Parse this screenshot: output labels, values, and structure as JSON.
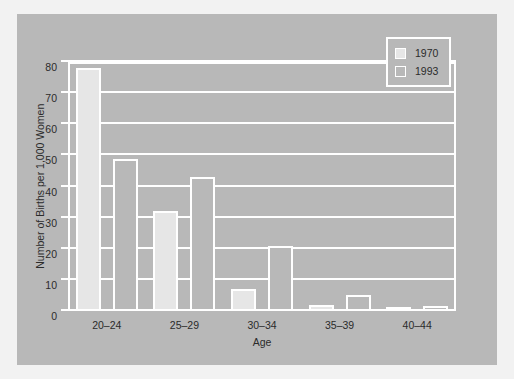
{
  "chart_data": {
    "type": "bar",
    "title": "",
    "xlabel": "Age",
    "ylabel": "Number of Births per 1,000 Women",
    "categories": [
      "20–24",
      "25–29",
      "30–34",
      "35–39",
      "40–44"
    ],
    "series": [
      {
        "name": "1970",
        "values": [
          78,
          32,
          7,
          2,
          0.5
        ]
      },
      {
        "name": "1993",
        "values": [
          49,
          43,
          21,
          5,
          1.5
        ]
      }
    ],
    "ylim": [
      0,
      80
    ],
    "yticks": [
      0,
      10,
      20,
      30,
      40,
      50,
      60,
      70,
      80
    ],
    "ytick_labels": [
      "0",
      "10",
      "20",
      "30",
      "40",
      "50",
      "60",
      "70",
      "80"
    ],
    "grid": "horizontal",
    "legend_position": "top-right",
    "colors": {
      "figure_background": "#f2f2f2",
      "plot_background": "#b8b8b8",
      "axis": "#ffffff",
      "gridline": "#ffffff",
      "text": "#2b2b2b",
      "series_1970_fill": "#e6e6e6",
      "series_1993_fill": "#b8b8b8",
      "bar_outline": "#ffffff"
    }
  },
  "legend": {
    "entries": [
      {
        "label": "1970",
        "swatch": "legend-swatch-1970"
      },
      {
        "label": "1993",
        "swatch": "legend-swatch-1993"
      }
    ]
  }
}
